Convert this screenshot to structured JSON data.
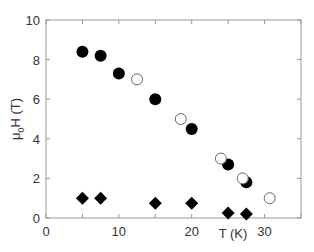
{
  "chart_data": {
    "type": "scatter",
    "title": "",
    "xlabel": "T (K)",
    "ylabel": "μ0H (T)",
    "xlim": [
      0,
      35
    ],
    "ylim": [
      0,
      10
    ],
    "x_ticks": [
      "0",
      "10",
      "20",
      "30"
    ],
    "y_ticks": [
      "0",
      "2",
      "4",
      "6",
      "8",
      "10"
    ],
    "grid": false,
    "legend": null,
    "series": [
      {
        "name": "filled-circles",
        "marker": "filled-circle",
        "x": [
          5,
          7.5,
          10,
          15,
          20,
          25,
          27.5
        ],
        "y": [
          8.4,
          8.2,
          7.3,
          6.0,
          4.5,
          2.7,
          1.8
        ]
      },
      {
        "name": "open-circles",
        "marker": "open-circle",
        "x": [
          12.5,
          18.5,
          24,
          27,
          30.7
        ],
        "y": [
          7.0,
          5.0,
          3.0,
          2.0,
          1.0
        ]
      },
      {
        "name": "diamonds",
        "marker": "filled-diamond",
        "x": [
          5,
          7.5,
          15,
          20,
          25,
          27.5
        ],
        "y": [
          1.0,
          1.0,
          0.75,
          0.75,
          0.25,
          0.2
        ]
      }
    ]
  },
  "labels": {
    "xlabel": "T (K)",
    "ylabel_main": "μ",
    "ylabel_sub": "0",
    "ylabel_rest": "H (T)"
  }
}
